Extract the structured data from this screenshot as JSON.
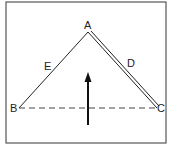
{
  "diagram": {
    "type": "triangle-vector-diagram",
    "points": {
      "A": {
        "label": "A",
        "x": 88,
        "y": 32
      },
      "B": {
        "label": "B",
        "x": 19,
        "y": 108
      },
      "C": {
        "label": "C",
        "x": 157,
        "y": 108
      }
    },
    "edges": [
      {
        "id": "E",
        "label": "E",
        "from": "A",
        "to": "B",
        "style": "single-line"
      },
      {
        "id": "D",
        "label": "D",
        "from": "A",
        "to": "C",
        "style": "double-line"
      },
      {
        "id": "BC",
        "label": "",
        "from": "B",
        "to": "C",
        "style": "dashed"
      }
    ],
    "arrow": {
      "direction": "up",
      "x": 88,
      "y_tail": 125,
      "y_head": 72
    },
    "colors": {
      "stroke": "#222222",
      "border": "#555555",
      "background": "#ffffff"
    }
  }
}
